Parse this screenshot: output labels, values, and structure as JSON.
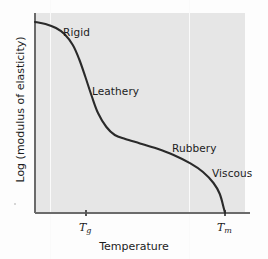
{
  "figure": {
    "background_color": "#fdfdfd",
    "plot_background_color": "#e6e6e6",
    "curve_color": "#2a2a2a",
    "axis_color": "#6b6b6b",
    "gridline_color": "#fafafa"
  },
  "axes": {
    "x_title": "Temperature",
    "y_title": "Log (modulus of elasticity)",
    "x_ticks": [
      {
        "id": "tg",
        "base": "T",
        "sub": "g"
      },
      {
        "id": "tm",
        "base": "T",
        "sub": "m"
      }
    ]
  },
  "chart_data": {
    "type": "line",
    "title": "",
    "xlabel": "Temperature",
    "ylabel": "Log (modulus of elasticity)",
    "grid": true,
    "legend": "none",
    "xlim": [
      0,
      1
    ],
    "ylim": [
      0,
      1
    ],
    "x_tick_labels": [
      "Tg",
      "Tm"
    ],
    "x_tick_positions": [
      0.238,
      0.9
    ],
    "annotations": [
      {
        "label": "Rigid",
        "x": 0.17,
        "y": 0.92
      },
      {
        "label": "Leathery",
        "x": 0.3,
        "y": 0.62
      },
      {
        "label": "Rubbery",
        "x": 0.68,
        "y": 0.35
      },
      {
        "label": "Viscous",
        "x": 0.88,
        "y": 0.22
      }
    ],
    "series": [
      {
        "name": "modulus of elasticity",
        "description": "Sigmoidal decay: glassy plateau, steep glass transition at Tg, rubbery plateau, then sharp drop to zero at Tm",
        "x": [
          0.0,
          0.05,
          0.1,
          0.14,
          0.18,
          0.21,
          0.24,
          0.27,
          0.3,
          0.34,
          0.38,
          0.43,
          0.5,
          0.58,
          0.66,
          0.74,
          0.8,
          0.85,
          0.88,
          0.9,
          0.905
        ],
        "y": [
          0.955,
          0.945,
          0.925,
          0.895,
          0.84,
          0.77,
          0.68,
          0.585,
          0.5,
          0.43,
          0.39,
          0.37,
          0.348,
          0.322,
          0.29,
          0.248,
          0.205,
          0.15,
          0.095,
          0.02,
          0.0
        ]
      }
    ]
  },
  "regions": {
    "rigid": "Rigid",
    "leathery": "Leathery",
    "rubbery": "Rubbery",
    "viscous": "Viscous"
  }
}
